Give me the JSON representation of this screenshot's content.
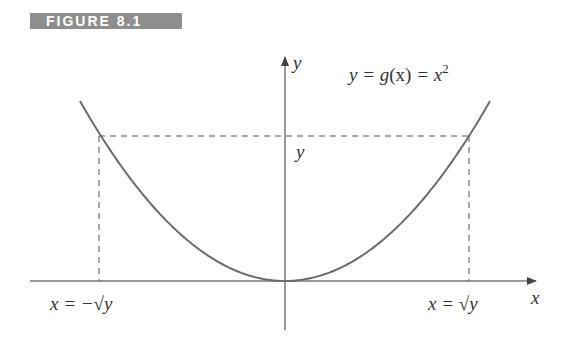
{
  "figure": {
    "label": "FIGURE 8.1"
  },
  "axes": {
    "x_label": "x",
    "y_label": "y"
  },
  "curve": {
    "equation_lhs": "y = g",
    "equation_paren": "(x)",
    "equation_rhs": " = x",
    "equation_exp": "2",
    "color": "#6b6b6b"
  },
  "annotations": {
    "y_level": "y",
    "left_root": "x = −√y",
    "right_root": "x = √y"
  },
  "colors": {
    "axis": "#555555",
    "dashed": "#555555",
    "label_bg": "#8e8e8e"
  }
}
